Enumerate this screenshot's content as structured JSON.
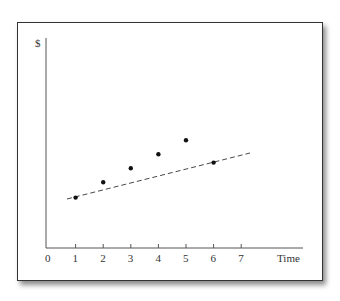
{
  "chart_data": {
    "type": "scatter",
    "title": "",
    "xlabel": "Time",
    "ylabel": "$",
    "x_ticks": [
      "0",
      "1",
      "2",
      "3",
      "4",
      "5",
      "6",
      "7"
    ],
    "xlim": [
      0,
      7.5
    ],
    "ylim": [
      0,
      15
    ],
    "grid": false,
    "series": [
      {
        "name": "points",
        "x": [
          1,
          2,
          3,
          4,
          5,
          6
        ],
        "y": [
          3.6,
          4.7,
          5.7,
          6.7,
          7.7,
          6.1
        ]
      },
      {
        "name": "trend-line",
        "style": "dashed",
        "x": [
          0.7,
          6.3
        ],
        "y": [
          3.5,
          6.8
        ]
      }
    ]
  }
}
